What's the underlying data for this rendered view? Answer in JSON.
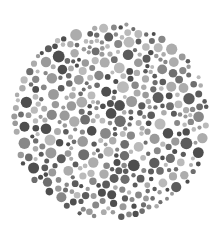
{
  "plate": {
    "type": "color-vision-test-plate",
    "center": [
      111,
      121
    ],
    "radius": 100,
    "background": "#ffffff",
    "palette": [
      "#4e4e4e",
      "#5c5c5c",
      "#6e6e6e",
      "#888888",
      "#9a9a9a",
      "#acacac",
      "#bababa"
    ],
    "dot_radius_range": [
      2,
      6
    ]
  }
}
